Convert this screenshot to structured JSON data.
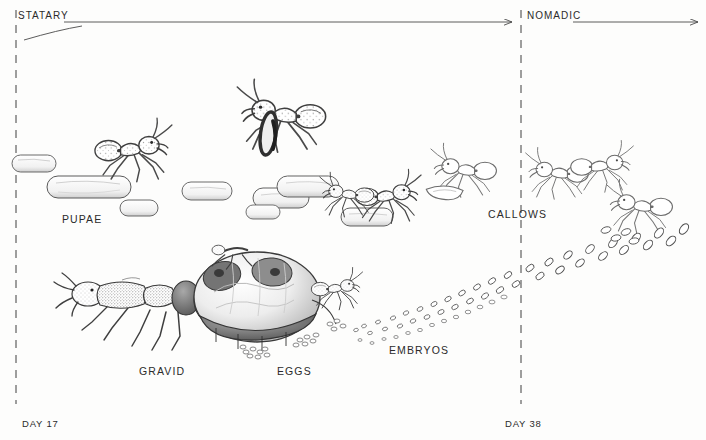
{
  "figure": {
    "title_phases": {
      "statary": "STATARY",
      "nomadic": "NOMADIC"
    },
    "timeline": {
      "day_start": "DAY 17",
      "day_end": "DAY 38"
    },
    "captions": [
      {
        "id": "pupae",
        "text": "PUPAE"
      },
      {
        "id": "callows",
        "text": "CALLOWS"
      },
      {
        "id": "gravid",
        "text": "GRAVID"
      },
      {
        "id": "eggs",
        "text": "EGGS"
      },
      {
        "id": "embryos",
        "text": "EMBRYOS"
      }
    ],
    "colors": {
      "ink": "#2b2b2b",
      "line": "#4a4a4a",
      "paper": "#fdfdfc",
      "shade_dark": "#5d5d5d",
      "shade_mid": "#9a9a9a",
      "shade_light": "#d2d2d2"
    }
  }
}
